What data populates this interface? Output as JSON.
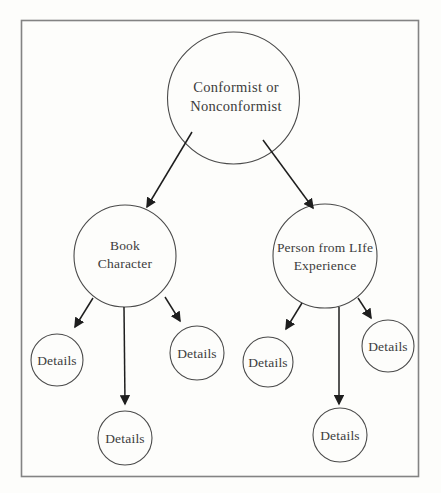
{
  "diagram": {
    "type": "tree",
    "colors": {
      "paper_bg": "#fdfdfb",
      "border": "#838383",
      "circle_stroke": "#4a4a4a",
      "arrow": "#1e1e1e",
      "text": "#3c3c3c"
    },
    "root": {
      "line1": "Conformist or",
      "line2": "Nonconformist"
    },
    "branch_left": {
      "line1": "Book",
      "line2": "Character"
    },
    "branch_right": {
      "line1": "Person from LIfe",
      "line2": "Experience"
    },
    "leaves": [
      "Details",
      "Details",
      "Details",
      "Details",
      "Details",
      "Details"
    ],
    "structure_note": "root connects to two branches; each branch connects to three leaf circles"
  }
}
